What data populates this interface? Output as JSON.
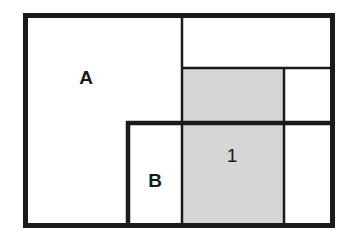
{
  "diagram": {
    "type": "rectangular-partition",
    "colors": {
      "background": "#ffffff",
      "stroke": "#1a1a1a",
      "shaded_fill": "#d6d6d6"
    },
    "regions": [
      {
        "id": "A",
        "label": "A",
        "shaded": false
      },
      {
        "id": "B",
        "label": "B",
        "shaded": false
      },
      {
        "id": "1",
        "label": "1",
        "shaded": true
      }
    ]
  }
}
